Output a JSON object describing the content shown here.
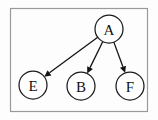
{
  "figure": {
    "background_color": "#fdfdfd",
    "frame": {
      "name": "diagram-frame",
      "stroke_color": "#9a9a9a",
      "x": 10,
      "y": 8,
      "width": 138,
      "height": 104
    },
    "canvas": {
      "width": 158,
      "height": 120
    }
  },
  "chart_data": {
    "type": "diagram",
    "graph_type": "directed",
    "title": "",
    "node_radius": 14,
    "node_fill": "#ffffff",
    "node_stroke": "#1a1a1a",
    "edge_color": "#141414",
    "nodes": [
      {
        "id": "A",
        "label": "A",
        "x": 109,
        "y": 29
      },
      {
        "id": "E",
        "label": "E",
        "x": 33,
        "y": 85
      },
      {
        "id": "B",
        "label": "B",
        "x": 81,
        "y": 86
      },
      {
        "id": "F",
        "label": "F",
        "x": 130,
        "y": 86
      }
    ],
    "edges": [
      {
        "from": "A",
        "to": "E",
        "directed": true
      },
      {
        "from": "A",
        "to": "B",
        "directed": true
      },
      {
        "from": "A",
        "to": "F",
        "directed": true
      }
    ]
  },
  "labels": {
    "node_a": "A",
    "node_e": "E",
    "node_b": "B",
    "node_f": "F"
  }
}
